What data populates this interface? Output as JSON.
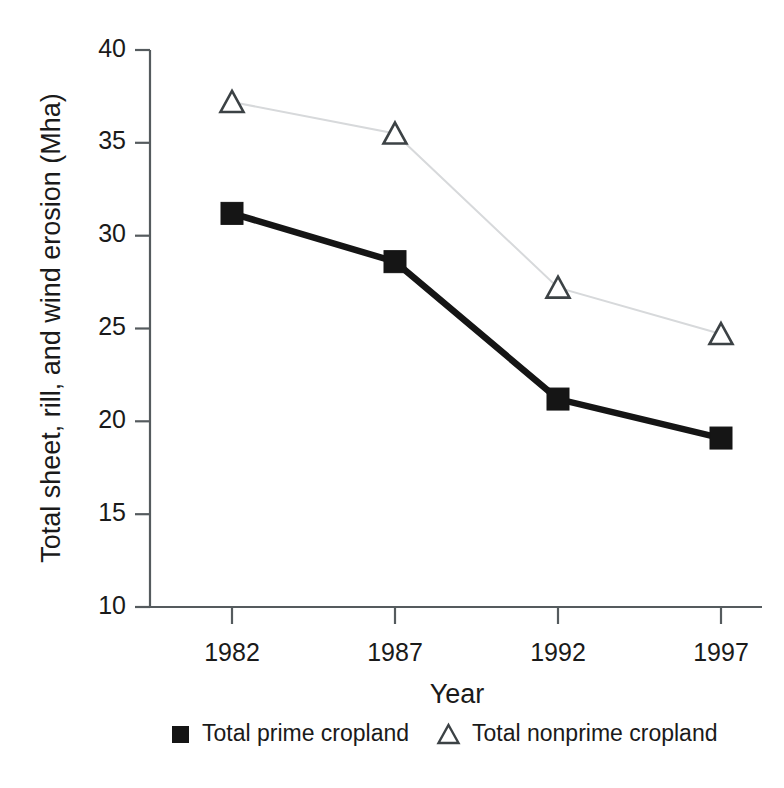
{
  "chart_data": {
    "type": "line",
    "title": "",
    "xlabel": "Year",
    "ylabel": "Total sheet, rill, and wind erosion (Mha)",
    "categories": [
      "1982",
      "1987",
      "1992",
      "1997"
    ],
    "x": [
      1982,
      1987,
      1992,
      1997
    ],
    "xtick_labels": [
      "1982",
      "1987",
      "1992",
      "1997"
    ],
    "ytick_labels": [
      "40",
      "35",
      "30",
      "25",
      "20",
      "15",
      "10"
    ],
    "yticks": [
      40,
      35,
      30,
      25,
      20,
      15,
      10
    ],
    "ylim": [
      10,
      40
    ],
    "xlim": [
      1980.5,
      1998.5
    ],
    "grid": false,
    "legend_position": "bottom",
    "series": [
      {
        "name": "Total prime cropland",
        "marker": "filled-square",
        "color": "#151515",
        "line_color": "#151515",
        "values": [
          31.2,
          28.6,
          21.2,
          19.1
        ]
      },
      {
        "name": "Total nonprime cropland",
        "marker": "open-triangle",
        "color": "#3c4245",
        "line_color": "#d7d9db",
        "values": [
          37.2,
          35.5,
          27.2,
          24.7
        ]
      }
    ]
  },
  "legend": {
    "items": [
      {
        "label": "Total prime cropland",
        "marker": "filled-square"
      },
      {
        "label": "Total nonprime cropland",
        "marker": "open-triangle"
      }
    ]
  },
  "axes": {
    "y_title": "Total sheet, rill, and wind erosion (Mha)",
    "x_title": "Year",
    "y_tick_0": "40",
    "y_tick_1": "35",
    "y_tick_2": "30",
    "y_tick_3": "25",
    "y_tick_4": "20",
    "y_tick_5": "15",
    "y_tick_6": "10",
    "x_tick_0": "1982",
    "x_tick_1": "1987",
    "x_tick_2": "1992",
    "x_tick_3": "1997"
  }
}
